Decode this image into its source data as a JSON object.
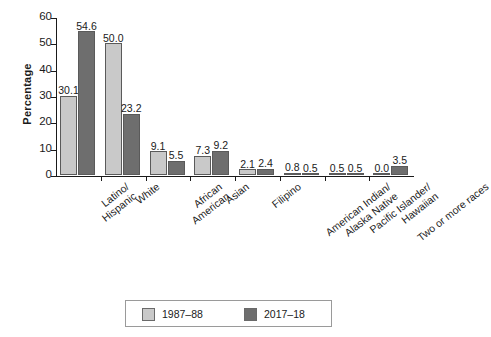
{
  "chart_data": {
    "type": "bar",
    "title": "",
    "xlabel": "",
    "ylabel": "Percentage",
    "ylim": [
      0,
      60
    ],
    "ytick_values": [
      0,
      10,
      20,
      30,
      40,
      50,
      60
    ],
    "ytick_labels": [
      "0",
      "10",
      "20",
      "30",
      "40",
      "50",
      "60"
    ],
    "grid": false,
    "legend_position": "bottom",
    "categories": [
      "Latino/\nHispanic",
      "White",
      "African\nAmerican",
      "Asian",
      "Filipino",
      "American Indian/\nAlaska Native",
      "Pacific Islander/\nHawaiian",
      "Two or more races"
    ],
    "category_lines": [
      [
        "Latino/",
        "Hispanic"
      ],
      [
        "White"
      ],
      [
        "African",
        "American"
      ],
      [
        "Asian"
      ],
      [
        "Filipino"
      ],
      [
        "American Indian/",
        "Alaska Native"
      ],
      [
        "Pacific Islander/",
        "Hawaiian"
      ],
      [
        "Two or more races"
      ]
    ],
    "series": [
      {
        "name": "1987–88",
        "color": "#c9c9c9",
        "values": [
          30.1,
          50.0,
          9.1,
          7.3,
          2.1,
          0.8,
          0.5,
          0.0
        ],
        "labels": [
          "30.1",
          "50.0",
          "9.1",
          "7.3",
          "2.1",
          "0.8",
          "0.5",
          "0.0"
        ]
      },
      {
        "name": "2017–18",
        "color": "#6e6e6e",
        "values": [
          54.6,
          23.2,
          5.5,
          9.2,
          2.4,
          0.5,
          0.5,
          3.5
        ],
        "labels": [
          "54.6",
          "23.2",
          "5.5",
          "9.2",
          "2.4",
          "0.5",
          "0.5",
          "3.5"
        ]
      }
    ]
  },
  "legend": {
    "items": [
      {
        "label": "1987–88",
        "color": "#c9c9c9"
      },
      {
        "label": "2017–18",
        "color": "#6e6e6e"
      }
    ]
  },
  "axis": {
    "y_title": "Percentage"
  }
}
